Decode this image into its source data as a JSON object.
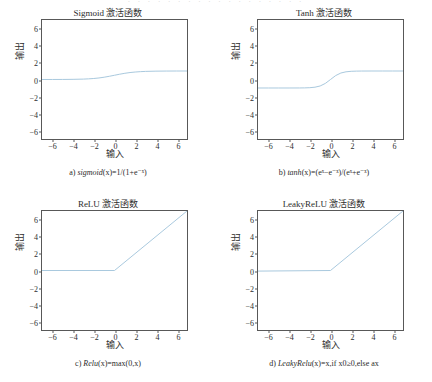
{
  "figure": {
    "top_fragment": "· · · ·   · · ·   · · · ·   · · ·   · · · ·",
    "line_color": "#a9c9de",
    "axis_color": "#585858",
    "background": "#ffffff"
  },
  "panels": [
    {
      "id": "sigmoid",
      "title": "Sigmoid 激活函数",
      "xlabel": "输入",
      "ylabel": "输出",
      "caption": "a) sigmoid(x)=1/(1+e⁻ˣ)",
      "caption_prefix": "a) ",
      "caption_fn": "sigmoid",
      "caption_rest": "(x)=1/(1+e⁻ˣ)"
    },
    {
      "id": "tanh",
      "title": "Tanh 激活函数",
      "xlabel": "输入",
      "ylabel": "输出",
      "caption": "b) tanh(x)=(eˣ−e⁻ˣ)/(eˣ+e⁻ˣ)",
      "caption_prefix": "b) ",
      "caption_fn": "tanh",
      "caption_rest": "(x)=(eˣ−e⁻ˣ)/(eˣ+e⁻ˣ)"
    },
    {
      "id": "relu",
      "title": "ReLU 激活函数",
      "xlabel": "输入",
      "ylabel": "输出",
      "caption": "c) Relu(x)=max(0,x)",
      "caption_prefix": "c) ",
      "caption_fn": "Relu",
      "caption_rest": "(x)=max(0,x)"
    },
    {
      "id": "leakyrelu",
      "title": "LeakyReLU 激活函数",
      "xlabel": "输入",
      "ylabel": "输出",
      "caption": "d) LeakyRelu(x)=x,if x0≥0,else ax",
      "caption_prefix": "d) ",
      "caption_fn": "LeakyRelu",
      "caption_rest": "(x)=x,if x0≥0,else ax"
    }
  ],
  "chart_data": [
    {
      "type": "line",
      "id": "sigmoid",
      "title": "Sigmoid 激活函数",
      "xlabel": "输入",
      "ylabel": "输出",
      "xlim": [
        -7,
        7
      ],
      "ylim": [
        -7,
        7
      ],
      "xticks": [
        -6,
        -4,
        -2,
        0,
        2,
        4,
        6
      ],
      "yticks": [
        -6,
        -4,
        -2,
        0,
        2,
        4,
        6
      ],
      "grid": false,
      "legend": null,
      "series": [
        {
          "name": "sigmoid(x)=1/(1+e^-x)",
          "color": "#a9c9de",
          "x": [
            -7,
            -6,
            -5,
            -4,
            -3,
            -2.5,
            -2,
            -1.5,
            -1,
            -0.5,
            0,
            0.5,
            1,
            1.5,
            2,
            2.5,
            3,
            4,
            5,
            6,
            7
          ],
          "y": [
            0.001,
            0.002,
            0.007,
            0.018,
            0.047,
            0.076,
            0.119,
            0.182,
            0.269,
            0.378,
            0.5,
            0.622,
            0.731,
            0.818,
            0.881,
            0.924,
            0.953,
            0.982,
            0.993,
            0.998,
            0.999
          ]
        }
      ]
    },
    {
      "type": "line",
      "id": "tanh",
      "title": "Tanh 激活函数",
      "xlabel": "输入",
      "ylabel": "输出",
      "xlim": [
        -7,
        7
      ],
      "ylim": [
        -7,
        7
      ],
      "xticks": [
        -6,
        -4,
        -2,
        0,
        2,
        4,
        6
      ],
      "yticks": [
        -6,
        -4,
        -2,
        0,
        2,
        4,
        6
      ],
      "grid": false,
      "legend": null,
      "series": [
        {
          "name": "tanh(x)=(e^x-e^-x)/(e^x+e^-x)",
          "color": "#a9c9de",
          "x": [
            -7,
            -6,
            -5,
            -4,
            -3,
            -2.5,
            -2,
            -1.5,
            -1,
            -0.5,
            0,
            0.5,
            1,
            1.5,
            2,
            2.5,
            3,
            4,
            5,
            6,
            7
          ],
          "y": [
            -1.0,
            -1.0,
            -0.9999,
            -0.9993,
            -0.995,
            -0.987,
            -0.964,
            -0.905,
            -0.762,
            -0.462,
            0.0,
            0.462,
            0.762,
            0.905,
            0.964,
            0.987,
            0.995,
            0.9993,
            0.9999,
            1.0,
            1.0
          ]
        }
      ]
    },
    {
      "type": "line",
      "id": "relu",
      "title": "ReLU 激活函数",
      "xlabel": "输入",
      "ylabel": "输出",
      "xlim": [
        -7,
        7
      ],
      "ylim": [
        -7,
        7
      ],
      "xticks": [
        -6,
        -4,
        -2,
        0,
        2,
        4,
        6
      ],
      "yticks": [
        -6,
        -4,
        -2,
        0,
        2,
        4,
        6
      ],
      "grid": false,
      "legend": null,
      "series": [
        {
          "name": "Relu(x)=max(0,x)",
          "color": "#a9c9de",
          "x": [
            -7,
            0,
            7
          ],
          "y": [
            0,
            0,
            7
          ]
        }
      ]
    },
    {
      "type": "line",
      "id": "leakyrelu",
      "title": "LeakyReLU 激活函数",
      "xlabel": "输入",
      "ylabel": "输出",
      "xlim": [
        -7,
        7
      ],
      "ylim": [
        -7,
        7
      ],
      "xticks": [
        -6,
        -4,
        -2,
        0,
        2,
        4,
        6
      ],
      "yticks": [
        -6,
        -4,
        -2,
        0,
        2,
        4,
        6
      ],
      "grid": false,
      "legend": null,
      "series": [
        {
          "name": "LeakyRelu(x)=x if x>=0 else ax",
          "color": "#a9c9de",
          "x": [
            -7,
            0,
            7
          ],
          "y": [
            -0.07,
            0,
            7
          ]
        }
      ]
    }
  ]
}
